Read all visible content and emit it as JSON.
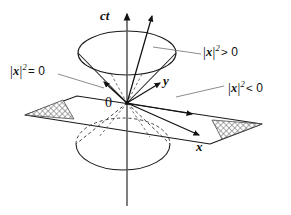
{
  "figure": {
    "background_color": "#ffffff",
    "line_color": "#1a1a1a",
    "hatch_color": "#5a5a5a",
    "width": 291,
    "height": 215
  },
  "axes": [
    {
      "id": "ct",
      "label": "ct",
      "description": "vertical time axis, arrow pointing up"
    },
    {
      "id": "y",
      "label": "y",
      "description": "spatial axis toward upper right"
    },
    {
      "id": "x",
      "label": "x",
      "description": "spatial axis toward lower right"
    }
  ],
  "origin": {
    "label": "0"
  },
  "regions": [
    {
      "id": "timelike",
      "label_parts": {
        "open_bar": "|",
        "vector": "x",
        "close_bar": "|",
        "exponent": "2",
        "relation": ">",
        "value": "0"
      },
      "label_text": "|x|2 > 0",
      "description": "inside the light cone (timelike separation)"
    },
    {
      "id": "lightlike",
      "label_parts": {
        "open_bar": "|",
        "vector": "x",
        "close_bar": "|",
        "exponent": "2",
        "relation": "=",
        "value": "0"
      },
      "label_text": "|x|2 = 0",
      "description": "on the light cone surface (lightlike / null separation)"
    },
    {
      "id": "spacelike",
      "label_parts": {
        "open_bar": "|",
        "vector": "x",
        "close_bar": "|",
        "exponent": "2",
        "relation": "<",
        "value": "0"
      },
      "label_text": "|x|2 < 0",
      "description": "outside the light cone (spacelike separation)"
    }
  ],
  "elements": {
    "upper_cone": "solid ellipse cap with straight cone sides meeting at origin",
    "lower_cone": "ellipse below the plane, dashed where hidden behind the plane",
    "plane": "parallelogram representing the x-y hyperplane through the origin",
    "hatched_left": "cross-hatched triangle at the left corner of the plane",
    "hatched_right": "cross-hatched triangle at the right corner of the plane",
    "vectors": "arrows from the origin into timelike, lightlike and spacelike regions"
  }
}
